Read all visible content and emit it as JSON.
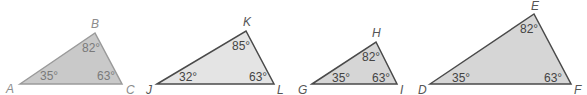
{
  "colors": {
    "faded_fill": "#c9c9c9",
    "faded_stroke": "#9a9a9a",
    "fill": "#d6d6d6",
    "light_fill": "#e4e4e4",
    "stroke": "#4a4a4a"
  },
  "triangles": [
    {
      "name": "ABC",
      "vertices": [
        {
          "label": "A",
          "angle": "35°"
        },
        {
          "label": "B",
          "angle": "82°"
        },
        {
          "label": "C",
          "angle": "63°"
        }
      ]
    },
    {
      "name": "JKL",
      "vertices": [
        {
          "label": "J",
          "angle": "32°"
        },
        {
          "label": "K",
          "angle": "85°"
        },
        {
          "label": "L",
          "angle": "63°"
        }
      ]
    },
    {
      "name": "GHI",
      "vertices": [
        {
          "label": "G",
          "angle": "35°"
        },
        {
          "label": "H",
          "angle": "82°"
        },
        {
          "label": "I",
          "angle": "63°"
        }
      ]
    },
    {
      "name": "DEF",
      "vertices": [
        {
          "label": "D",
          "angle": "35°"
        },
        {
          "label": "E",
          "angle": "82°"
        },
        {
          "label": "F",
          "angle": "63°"
        }
      ]
    }
  ]
}
